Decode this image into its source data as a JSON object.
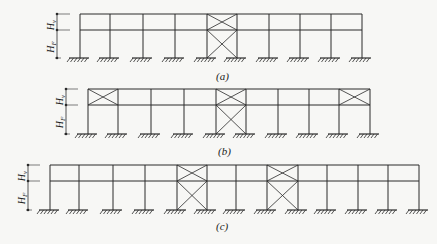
{
  "figure": {
    "dimension_labels": {
      "upper": "H",
      "upper_sub": "v",
      "lower": "H",
      "lower_sub": "F"
    },
    "panels": [
      {
        "id": "a",
        "caption": "(a)",
        "top_y": 14,
        "mid_y": 30,
        "base_y": 58,
        "columns_x": [
          80,
          110,
          143,
          175,
          207,
          237,
          269,
          300,
          331,
          362
        ],
        "braced_bays": [
          {
            "bay": 4,
            "upper": true,
            "lower": true
          }
        ],
        "dim_x": 57
      },
      {
        "id": "b",
        "caption": "(b)",
        "top_y": 89,
        "mid_y": 105,
        "base_y": 134,
        "columns_x": [
          88,
          118,
          151,
          184,
          216,
          246,
          278,
          309,
          339,
          370
        ],
        "braced_bays": [
          {
            "bay": 0,
            "upper": true,
            "lower": false
          },
          {
            "bay": 4,
            "upper": true,
            "lower": true
          },
          {
            "bay": 8,
            "upper": true,
            "lower": false
          }
        ],
        "dim_x": 66
      },
      {
        "id": "c",
        "caption": "(c)",
        "top_y": 165,
        "mid_y": 181,
        "base_y": 210,
        "columns_x": [
          50,
          79,
          113,
          145,
          177,
          207,
          236,
          267,
          298,
          327,
          358,
          388,
          419
        ],
        "braced_bays": [
          {
            "bay": 4,
            "upper": true,
            "lower": true
          },
          {
            "bay": 7,
            "upper": true,
            "lower": true
          }
        ],
        "dim_x": 28
      }
    ],
    "captions": {
      "a": "(a)",
      "b": "(b)",
      "c": "(c)"
    }
  }
}
